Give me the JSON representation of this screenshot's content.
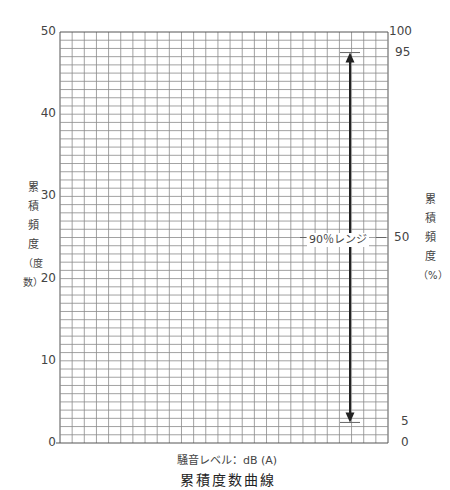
{
  "chart_data": {
    "type": "line",
    "title": "累積度数曲線",
    "xlabel": "騒音レベル：dB (A)",
    "ylabel_left": "累積頻度（度数）",
    "ylabel_right": "累積頻度（%）",
    "ylim_left": [
      0,
      50
    ],
    "ylim_right": [
      0,
      100
    ],
    "left_ticks": [
      "0",
      "10",
      "20",
      "30",
      "40",
      "50"
    ],
    "right_ticks": [
      "0",
      "5",
      "50",
      "95",
      "100"
    ],
    "grid": true,
    "grid_columns": 27,
    "grid_rows": 50,
    "annotations": [
      {
        "type": "double-arrow",
        "from_percent": 5,
        "to_percent": 95,
        "label": "90％レンジ"
      }
    ],
    "series": []
  },
  "labels": {
    "left_axis_chars": [
      "累",
      "積",
      "頻",
      "度",
      "（度",
      "数）"
    ],
    "right_axis_chars": [
      "累",
      "積",
      "頻",
      "度",
      "（%）"
    ],
    "x_axis": "騒音レベル：dB (A)",
    "title": "累積度数曲線",
    "range": "90％レンジ"
  }
}
